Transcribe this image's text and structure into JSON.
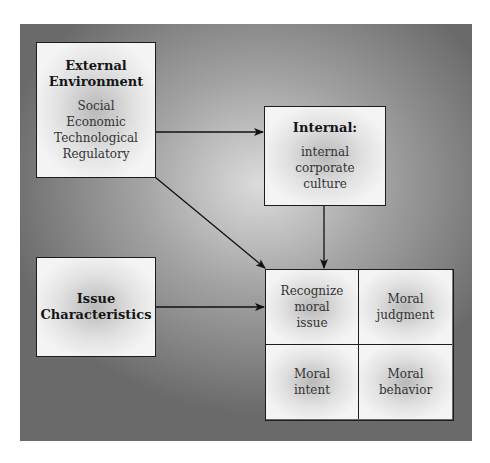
{
  "diagram": {
    "type": "flow",
    "nodes": {
      "external": {
        "title_line1": "External",
        "title_line2": "Environment",
        "items": [
          "Social",
          "Economic",
          "Technological",
          "Regulatory"
        ]
      },
      "internal": {
        "title": "Internal:",
        "items": [
          "internal",
          "corporate",
          "culture"
        ]
      },
      "issue": {
        "title_line1": "Issue",
        "title_line2": "Characteristics"
      },
      "moral_process": {
        "cells": [
          {
            "lines": [
              "Recognize",
              "moral",
              "issue"
            ]
          },
          {
            "lines": [
              "Moral",
              "judgment"
            ]
          },
          {
            "lines": [
              "Moral",
              "intent"
            ]
          },
          {
            "lines": [
              "Moral",
              "behavior"
            ]
          }
        ]
      }
    },
    "edges": [
      {
        "from": "External Environment",
        "to": "Internal"
      },
      {
        "from": "External Environment",
        "to": "Recognize moral issue"
      },
      {
        "from": "Internal",
        "to": "Recognize moral issue"
      },
      {
        "from": "Issue Characteristics",
        "to": "Recognize moral issue"
      }
    ]
  }
}
